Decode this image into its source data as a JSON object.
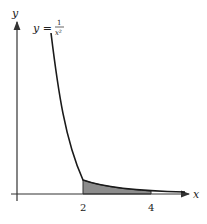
{
  "figure": {
    "function_label": "y = 1/x²",
    "function_lhs": "y =",
    "function_num": "1",
    "function_den": "x²",
    "x_axis_label": "x",
    "y_axis_label": "y",
    "x_ticks": [
      "2",
      "4"
    ],
    "shaded_region": {
      "from": 2,
      "to": 4
    },
    "colors": {
      "curve": "#1a1a1a",
      "shade": "#8c8c8c",
      "axis": "#333333"
    }
  }
}
